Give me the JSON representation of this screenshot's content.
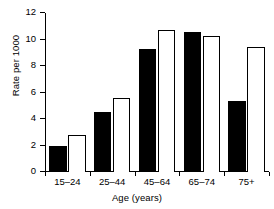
{
  "chart_data": {
    "type": "bar",
    "title": "",
    "xlabel": "Age (years)",
    "ylabel": "Rate per 1000",
    "categories": [
      "15–24",
      "25–44",
      "45–64",
      "65–74",
      "75+"
    ],
    "series": [
      {
        "name": "series-1",
        "style": "filled-black",
        "color": "#000000",
        "values": [
          2.0,
          4.5,
          9.25,
          10.55,
          5.35
        ]
      },
      {
        "name": "series-2",
        "style": "open-white",
        "color": "#ffffff",
        "edge_color": "#000000",
        "values": [
          2.8,
          5.6,
          10.7,
          10.3,
          9.4
        ]
      }
    ],
    "ylim": [
      0,
      12
    ],
    "yticks": [
      0,
      2,
      4,
      6,
      8,
      10,
      12
    ],
    "ytick_labels": [
      "0",
      "2",
      "4",
      "6",
      "8",
      "10",
      "12"
    ],
    "grid": false,
    "legend": "none"
  }
}
